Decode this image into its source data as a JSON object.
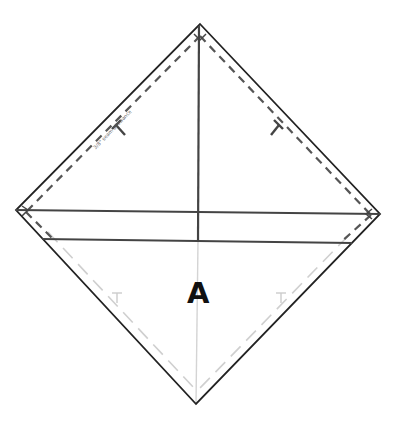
{
  "diagram": {
    "type": "sewing-pattern-piece",
    "piece_label": "A",
    "edge_note": "3/8\" seam allowance",
    "colors": {
      "background": "#ffffff",
      "cut_line": "#222222",
      "seam_line": "#555555",
      "fold_line": "#444444",
      "lower_guide": "#cfcfcf",
      "label": "#111111"
    },
    "vertices": {
      "top": [
        200,
        24
      ],
      "left": [
        16,
        210
      ],
      "right": [
        380,
        214
      ],
      "bottom": [
        196,
        404
      ]
    },
    "lines": {
      "center_vertical_dark": [
        [
          199,
          24
        ],
        [
          198,
          241
        ]
      ],
      "center_vertical_light": [
        [
          198,
          241
        ],
        [
          196,
          404
        ]
      ],
      "upper_horizontal": [
        [
          16,
          210
        ],
        [
          380,
          214
        ]
      ],
      "lower_horizontal": [
        [
          42,
          239
        ],
        [
          352,
          243
        ]
      ]
    },
    "marks": [
      {
        "name": "notch-upper-left",
        "position": [
          118,
          128
        ]
      },
      {
        "name": "notch-upper-right",
        "position": [
          278,
          128
        ]
      },
      {
        "name": "notch-lower-left",
        "position": [
          117,
          297
        ]
      },
      {
        "name": "notch-lower-right",
        "position": [
          281,
          297
        ]
      }
    ]
  }
}
